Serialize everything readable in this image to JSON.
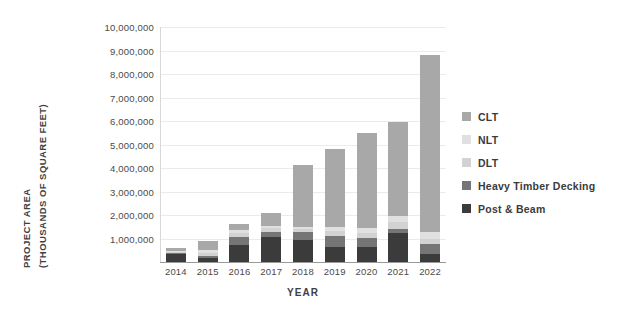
{
  "chart_data": {
    "type": "bar",
    "stacked": true,
    "title": "",
    "xlabel": "YEAR",
    "ylabel": "PROJECT AREA (THOUSANDS OF SQUARE FEET)",
    "ylabel_lines": [
      "PROJECT AREA",
      "(THOUSANDS OF SQUARE FEET)"
    ],
    "categories": [
      "2014",
      "2015",
      "2016",
      "2017",
      "2018",
      "2019",
      "2020",
      "2021",
      "2022"
    ],
    "ylim": [
      0,
      10000000
    ],
    "ytick_step": 1000000,
    "ytick_labels": [
      "10,000,000",
      "9,000,000",
      "8,000,000",
      "7,000,000",
      "6,000,000",
      "5,000,000",
      "4,000,000",
      "3,000,000",
      "2,000,000",
      "1,000,000"
    ],
    "ytick_values": [
      10000000,
      9000000,
      8000000,
      7000000,
      6000000,
      5000000,
      4000000,
      3000000,
      2000000,
      1000000
    ],
    "grid": true,
    "legend_position": "right",
    "stack_order_bottom_to_top": [
      "Post & Beam",
      "Heavy Timber Decking",
      "DLT",
      "NLT",
      "CLT"
    ],
    "series": [
      {
        "name": "Post & Beam",
        "color": "#3b3b3b",
        "values": [
          330000,
          180000,
          720000,
          1050000,
          930000,
          620000,
          620000,
          1230000,
          330000
        ]
      },
      {
        "name": "Heavy Timber Decking",
        "color": "#757575",
        "values": [
          60000,
          70000,
          330000,
          230000,
          330000,
          500000,
          420000,
          180000,
          420000
        ]
      },
      {
        "name": "DLT",
        "color": "#d2d2d2",
        "values": [
          30000,
          120000,
          180000,
          150000,
          130000,
          180000,
          180000,
          290000,
          230000
        ]
      },
      {
        "name": "NLT",
        "color": "#e0e0e0",
        "values": [
          30000,
          140000,
          120000,
          100000,
          120000,
          180000,
          230000,
          270000,
          290000
        ]
      },
      {
        "name": "CLT",
        "color": "#a8a8a8",
        "values": [
          150000,
          390000,
          250000,
          570000,
          2640000,
          3320000,
          4050000,
          3980000,
          7530000
        ]
      }
    ],
    "totals": [
      600000,
      900000,
      1600000,
      2100000,
      4150000,
      4800000,
      5500000,
      5950000,
      8800000
    ]
  },
  "legend": {
    "items": [
      {
        "label": "CLT",
        "color": "#a8a8a8"
      },
      {
        "label": "NLT",
        "color": "#e0e0e0"
      },
      {
        "label": "DLT",
        "color": "#d2d2d2"
      },
      {
        "label": "Heavy Timber Decking",
        "color": "#757575"
      },
      {
        "label": "Post & Beam",
        "color": "#3b3b3b"
      }
    ]
  },
  "colors": {
    "gridline": "#ebebeb",
    "axis": "#9a9a9a",
    "text": "#3b3b3b",
    "background": "#ffffff"
  }
}
